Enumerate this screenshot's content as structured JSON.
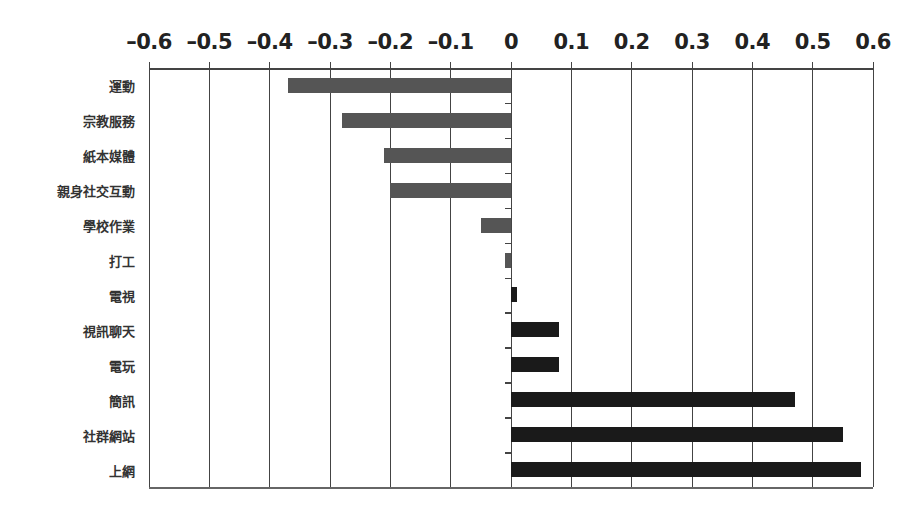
{
  "chart_data": {
    "type": "bar",
    "orientation": "horizontal",
    "title": "",
    "xlabel": "",
    "ylabel": "",
    "xlim": [
      -0.6,
      0.6
    ],
    "x_ticks": [
      "–0.6",
      "–0.5",
      "–0.4",
      "–0.3",
      "–0.2",
      "–0.1",
      "0",
      "0.1",
      "0.2",
      "0.3",
      "0.4",
      "0.5",
      "0.6"
    ],
    "x_tick_values": [
      -0.6,
      -0.5,
      -0.4,
      -0.3,
      -0.2,
      -0.1,
      0,
      0.1,
      0.2,
      0.3,
      0.4,
      0.5,
      0.6
    ],
    "x_axis_position": "top",
    "grid": "vertical",
    "legend": "none",
    "categories": [
      "運動",
      "宗教服務",
      "紙本媒體",
      "親身社交互動",
      "學校作業",
      "打工",
      "電視",
      "視訊聊天",
      "電玩",
      "簡訊",
      "社群網站",
      "上網"
    ],
    "values": [
      -0.37,
      -0.28,
      -0.21,
      -0.2,
      -0.05,
      -0.01,
      0.01,
      0.08,
      0.08,
      0.47,
      0.55,
      0.58
    ],
    "colors": {
      "negative": "#555555",
      "positive": "#1a1a1a",
      "grid": "#444444"
    }
  }
}
